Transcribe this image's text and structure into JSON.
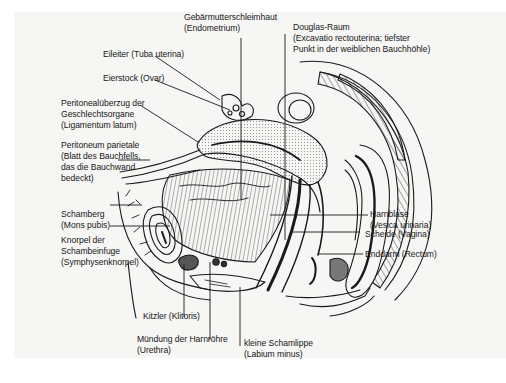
{
  "diagram": {
    "type": "anatomical-illustration",
    "language": "de",
    "colors": {
      "background": "#f6f6f4",
      "ink": "#161616",
      "frame": "#ffffff"
    },
    "labels": {
      "endometrium": {
        "line1": "Gebärmutterschleimhaut",
        "line2": "(Endometrium)"
      },
      "douglas": {
        "line1": "Douglas-Raum",
        "line2": "(Excavatio rectouterina; tiefster",
        "line3": "Punkt in der weiblichen Bauchhöhle)"
      },
      "eileiter": {
        "line1": "Eileiter (Tuba uterina)"
      },
      "eierstock": {
        "line1": "Eierstock (Ovar)"
      },
      "peritonealueberzug": {
        "line1": "Peritonealüberzug der",
        "line2": "Geschlechtsorgane",
        "line3": "(Ligamentum latum)"
      },
      "peritoneum": {
        "line1": "Peritoneum parietale",
        "line2": "(Blatt des Bauchfells,",
        "line3": "das die Bauchwand",
        "line4": "bedeckt)"
      },
      "schamberg": {
        "line1": "Schamberg",
        "line2": "(Mons pubis)"
      },
      "knorpel": {
        "line1": "Knorpel der",
        "line2": "Schambeinfuge",
        "line3": "(Symphysenknorpel)"
      },
      "harnblase": {
        "line1": "Harnblase",
        "line2": "(Vesica urinaria)"
      },
      "scheide": {
        "line1": "Scheide (Vagina)"
      },
      "enddarm": {
        "line1": "Enddarm (Rectum)"
      },
      "kitzler": {
        "line1": "Kitzler (Klitoris)"
      },
      "harnroehre": {
        "line1": "Mündung der Harnröhre",
        "line2": "(Urethra)"
      },
      "schamlippe": {
        "line1": "kleine Schamlippe",
        "line2": "(Labium minus)"
      }
    }
  }
}
